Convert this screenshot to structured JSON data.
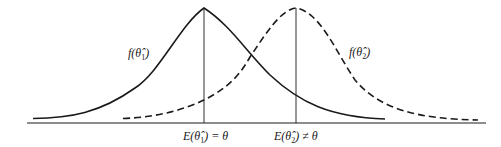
{
  "figure": {
    "type": "two probability density curves illustrating unbiased vs biased estimators",
    "curves": [
      {
        "name": "f(θ̂1)",
        "style": "solid",
        "label_main": "f(θ̂",
        "label_sub": "1",
        "label_close": ")",
        "mean_label": "E(θ̂1) = θ"
      },
      {
        "name": "f(θ̂2)",
        "style": "dashed",
        "label_main": "f(θ̂",
        "label_sub": "2",
        "label_close": ")",
        "mean_label": "E(θ̂2) ≠ θ"
      }
    ],
    "axis_labels": {
      "e1_pre": "E(θ̂",
      "e1_sub": "1",
      "e1_post": ") = θ",
      "e2_pre": "E(θ̂",
      "e2_sub": "2",
      "e2_post": ") ≠ θ"
    },
    "colors": {
      "line": "#1a1a1a",
      "background": "#ffffff"
    }
  }
}
